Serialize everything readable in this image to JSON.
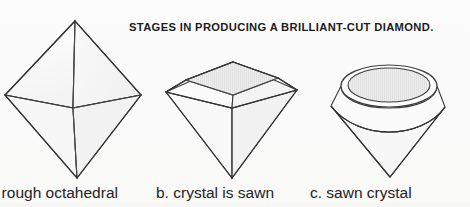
{
  "figure": {
    "title": "STAGES IN PRODUCING A BRILLIANT-CUT DIAMOND.",
    "background_color": "#fbfbfa",
    "ink_color": "#3a3a3a",
    "facet_fill": "#fbfbfb",
    "table_fill": "#ededed"
  },
  "captions": {
    "a": ". rough octahedral",
    "b": "b. crystal is sawn",
    "c": "c. sawn crystal"
  },
  "diagrams": [
    {
      "id": "rough-octahedral-crystal",
      "label": "a. rough octahedral",
      "shape": "octahedron",
      "description": "Rough octahedral diamond crystal shown point up and point down with a central vertical edge and a V-shaped waist girdle.",
      "vertices": {
        "top_apex": [
          75,
          21
        ],
        "left": [
          5,
          95
        ],
        "right": [
          141,
          95
        ],
        "bottom_apex": [
          77,
          178
        ],
        "front_center": [
          73,
          108
        ]
      }
    },
    {
      "id": "crystal-is-sawn",
      "label": "b. crystal is sawn",
      "shape": "sawn-octahedron",
      "description": "Octahedral crystal sawn across the waist producing a flat square table, four crown facets, a girdle and a pointed pavilion.",
      "vertices": {
        "table_back": [
          233,
          62
        ],
        "table_left": [
          186,
          80
        ],
        "table_front": [
          233,
          95
        ],
        "table_right": [
          278,
          78
        ],
        "girdle_left": [
          166,
          92
        ],
        "girdle_right": [
          297,
          90
        ],
        "girdle_front": [
          232,
          108
        ],
        "bottom_apex": [
          232,
          178
        ]
      }
    },
    {
      "id": "sawn-crystal",
      "label": "c. sawn crystal",
      "shape": "rounded-cone",
      "description": "Sawn crystal rounded (bruted) into a cone with a circular table ellipse on top, a girdle ellipse and a conical pavilion ending in a point.",
      "vertices": {
        "table_ellipse_center": [
          389,
          85
        ],
        "table_ellipse_radii": [
          48,
          19
        ],
        "girdle_left": [
          331,
          106
        ],
        "girdle_right": [
          445,
          107
        ],
        "girdle_front": [
          389,
          128
        ],
        "bottom_apex": [
          390,
          177
        ]
      }
    }
  ]
}
